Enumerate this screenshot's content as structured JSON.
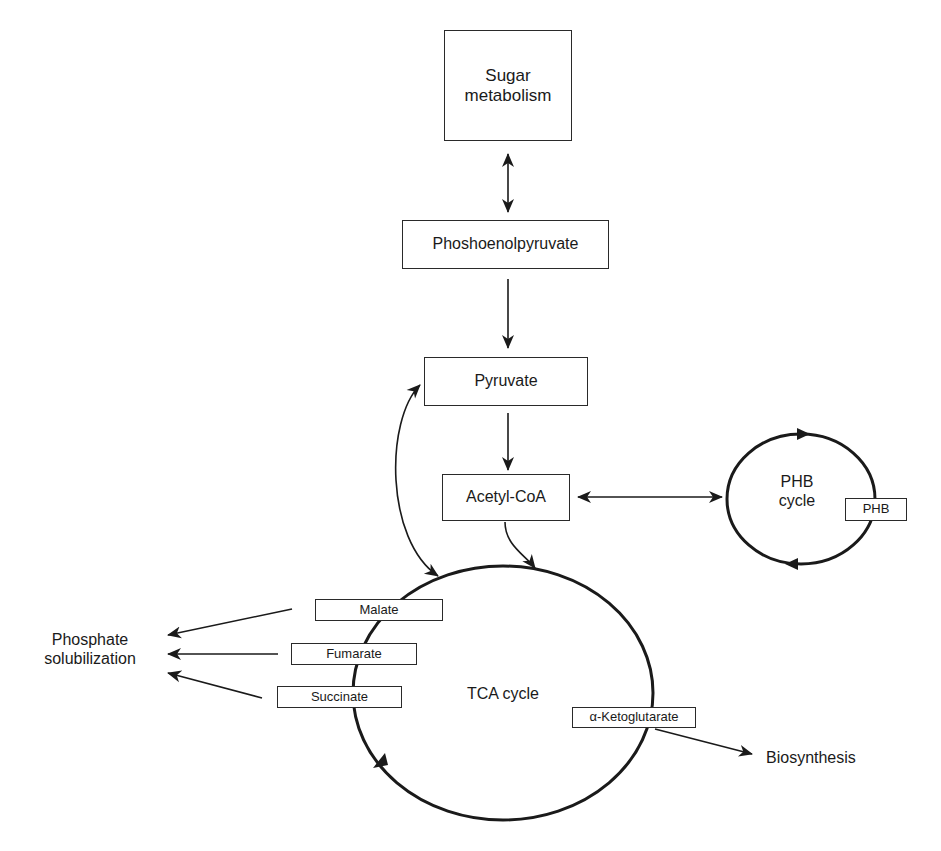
{
  "diagram": {
    "nodes": {
      "sugar": "Sugar\nmetabolism",
      "pep": "Phoshoenolpyruvate",
      "pyruvate": "Pyruvate",
      "acetyl": "Acetyl-CoA",
      "phb_cycle": "PHB\ncycle",
      "phb": "PHB",
      "tca_cycle": "TCA cycle",
      "malate": "Malate",
      "fumarate": "Fumarate",
      "succinate": "Succinate",
      "akg": "α-Ketoglutarate",
      "phosphate": "Phosphate\nsolubilization",
      "biosynthesis": "Biosynthesis"
    },
    "edges": [
      {
        "from": "Sugar metabolism",
        "to": "Phoshoenolpyruvate",
        "type": "bidirectional"
      },
      {
        "from": "Phoshoenolpyruvate",
        "to": "Pyruvate",
        "type": "directed"
      },
      {
        "from": "Pyruvate",
        "to": "Acetyl-CoA",
        "type": "directed"
      },
      {
        "from": "Acetyl-CoA",
        "to": "PHB cycle",
        "type": "bidirectional"
      },
      {
        "from": "Acetyl-CoA",
        "to": "TCA cycle",
        "type": "directed"
      },
      {
        "from": "Pyruvate",
        "to": "TCA cycle",
        "type": "bidirectional"
      },
      {
        "from": "Malate",
        "to": "Phosphate solubilization",
        "type": "directed"
      },
      {
        "from": "Fumarate",
        "to": "Phosphate solubilization",
        "type": "directed"
      },
      {
        "from": "Succinate",
        "to": "Phosphate solubilization",
        "type": "directed"
      },
      {
        "from": "α-Ketoglutarate",
        "to": "Biosynthesis",
        "type": "directed"
      }
    ]
  }
}
